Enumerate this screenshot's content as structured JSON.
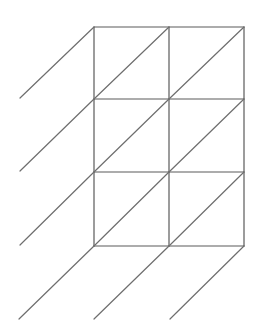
{
  "diagram": {
    "type": "lattice-multiplication-grid",
    "rows": 3,
    "cols": 2,
    "colors": {
      "background": "#ffffff",
      "grid_line": "#5a5a5a",
      "diagonal_line": "#6e6e6e"
    },
    "grid": {
      "x": [
        94,
        169,
        244
      ],
      "y": [
        27,
        99,
        172,
        246
      ]
    },
    "diagonals": [
      {
        "x1": 94,
        "y1": 27,
        "x2": 20,
        "y2": 98
      },
      {
        "x1": 169,
        "y1": 27,
        "x2": 94,
        "y2": 99
      },
      {
        "x1": 244,
        "y1": 27,
        "x2": 169,
        "y2": 99
      },
      {
        "x1": 94,
        "y1": 99,
        "x2": 20,
        "y2": 171
      },
      {
        "x1": 169,
        "y1": 99,
        "x2": 94,
        "y2": 172
      },
      {
        "x1": 244,
        "y1": 99,
        "x2": 169,
        "y2": 172
      },
      {
        "x1": 94,
        "y1": 172,
        "x2": 20,
        "y2": 245
      },
      {
        "x1": 169,
        "y1": 172,
        "x2": 94,
        "y2": 246
      },
      {
        "x1": 244,
        "y1": 172,
        "x2": 169,
        "y2": 246
      },
      {
        "x1": 94,
        "y1": 246,
        "x2": 19,
        "y2": 319
      },
      {
        "x1": 169,
        "y1": 246,
        "x2": 94,
        "y2": 319
      },
      {
        "x1": 244,
        "y1": 246,
        "x2": 170,
        "y2": 319
      }
    ]
  }
}
